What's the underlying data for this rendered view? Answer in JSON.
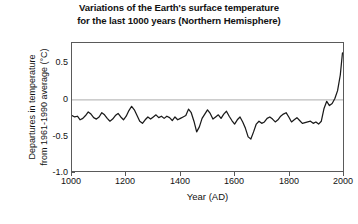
{
  "chart_data": {
    "type": "line",
    "title": "Variations of the Earth's surface temperature for the last 1000 years (Northern Hemisphere)",
    "title_lines": [
      "Variations of the Earth's surface temperature",
      "for the last 1000 years (Northern Hemisphere)"
    ],
    "xlabel": "Year (AD)",
    "ylabel": "Departures in temperature from 1961-1990 average (°C)",
    "ylabel_lines": [
      "Departures in temperature",
      "from 1961-1990 average (°C)"
    ],
    "xlim": [
      1000,
      2000
    ],
    "ylim": [
      -1.0,
      0.8
    ],
    "xticks": [
      1000,
      1200,
      1400,
      1600,
      1800,
      2000
    ],
    "xtick_labels": [
      "1000",
      "1200",
      "1400",
      "1600",
      "1800",
      "2000"
    ],
    "yticks": [
      0.5,
      0,
      -0.5,
      -1.0
    ],
    "ytick_labels": [
      "0.5",
      "0",
      "-0.5",
      "-1.0"
    ],
    "grid": false,
    "zero_line": true,
    "zero_line_color": "#bdbdbd",
    "line_color": "#1a1a1a",
    "legend": null,
    "series": [
      {
        "name": "Northern Hemisphere temperature anomaly",
        "x": [
          1000,
          1010,
          1020,
          1030,
          1040,
          1050,
          1060,
          1070,
          1080,
          1090,
          1100,
          1110,
          1120,
          1130,
          1140,
          1150,
          1160,
          1170,
          1180,
          1190,
          1200,
          1210,
          1220,
          1230,
          1240,
          1250,
          1260,
          1270,
          1280,
          1290,
          1300,
          1310,
          1320,
          1330,
          1340,
          1350,
          1360,
          1370,
          1380,
          1390,
          1400,
          1410,
          1420,
          1430,
          1440,
          1450,
          1460,
          1470,
          1480,
          1490,
          1500,
          1510,
          1520,
          1530,
          1540,
          1550,
          1560,
          1570,
          1580,
          1590,
          1600,
          1610,
          1620,
          1630,
          1640,
          1650,
          1660,
          1670,
          1680,
          1690,
          1700,
          1710,
          1720,
          1730,
          1740,
          1750,
          1760,
          1770,
          1780,
          1790,
          1800,
          1810,
          1820,
          1830,
          1840,
          1850,
          1860,
          1870,
          1880,
          1890,
          1900,
          1910,
          1920,
          1930,
          1940,
          1950,
          1960,
          1970,
          1980,
          1990,
          1998
        ],
        "values": [
          -0.22,
          -0.24,
          -0.23,
          -0.28,
          -0.26,
          -0.22,
          -0.17,
          -0.2,
          -0.25,
          -0.27,
          -0.24,
          -0.18,
          -0.21,
          -0.26,
          -0.3,
          -0.27,
          -0.22,
          -0.19,
          -0.24,
          -0.28,
          -0.23,
          -0.15,
          -0.09,
          -0.14,
          -0.22,
          -0.3,
          -0.33,
          -0.28,
          -0.24,
          -0.27,
          -0.24,
          -0.21,
          -0.25,
          -0.23,
          -0.26,
          -0.23,
          -0.25,
          -0.29,
          -0.24,
          -0.28,
          -0.26,
          -0.24,
          -0.22,
          -0.13,
          -0.18,
          -0.3,
          -0.45,
          -0.38,
          -0.26,
          -0.2,
          -0.14,
          -0.19,
          -0.27,
          -0.24,
          -0.21,
          -0.26,
          -0.2,
          -0.16,
          -0.23,
          -0.29,
          -0.34,
          -0.28,
          -0.24,
          -0.31,
          -0.4,
          -0.52,
          -0.55,
          -0.45,
          -0.34,
          -0.3,
          -0.33,
          -0.31,
          -0.26,
          -0.24,
          -0.27,
          -0.31,
          -0.28,
          -0.23,
          -0.2,
          -0.18,
          -0.24,
          -0.31,
          -0.28,
          -0.25,
          -0.29,
          -0.33,
          -0.32,
          -0.31,
          -0.3,
          -0.33,
          -0.31,
          -0.34,
          -0.3,
          -0.12,
          -0.02,
          -0.08,
          -0.05,
          0.02,
          0.13,
          0.35,
          0.66
        ],
        "units": "°C"
      }
    ],
    "annotations": []
  }
}
